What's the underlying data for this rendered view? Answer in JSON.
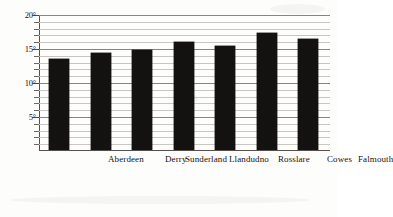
{
  "chart_data": {
    "type": "bar",
    "title": "",
    "subtitle": "",
    "xlabel": "",
    "ylabel": "",
    "categories": [
      "Aberdeen",
      "Derry",
      "Sunderland",
      "Llandudno",
      "Rosslare",
      "Cowes",
      "Falmouth"
    ],
    "values": [
      13.5,
      14.4,
      14.8,
      16.1,
      15.4,
      17.4,
      16.5
    ],
    "unit": "°",
    "ylim": [
      0,
      20
    ],
    "y_major_ticks": [
      5,
      10,
      15,
      20
    ],
    "y_major_tick_labels": [
      "5°",
      "10°",
      "15°",
      "20°"
    ],
    "y_minor_tick_step": 1,
    "grid": true,
    "grid_minor": true,
    "legend": "none",
    "bar_color": "#141210",
    "grid_color": "#c9c5c1",
    "axis_color": "#55504c",
    "background": "#fdfdfc"
  },
  "axis": {
    "ticks": [
      {
        "label": "20°",
        "value": 20
      },
      {
        "label": "15°",
        "value": 15
      },
      {
        "label": "10°",
        "value": 10
      },
      {
        "label": "5°",
        "value": 5
      }
    ]
  },
  "bars": [
    {
      "label": "Aberdeen",
      "value": 13.5
    },
    {
      "label": "Derry",
      "value": 14.4
    },
    {
      "label": "Sunderland",
      "value": 14.8
    },
    {
      "label": "Llandudno",
      "value": 16.1
    },
    {
      "label": "Rosslare",
      "value": 15.4
    },
    {
      "label": "Cowes",
      "value": 17.4
    },
    {
      "label": "Falmouth",
      "value": 16.5
    }
  ]
}
